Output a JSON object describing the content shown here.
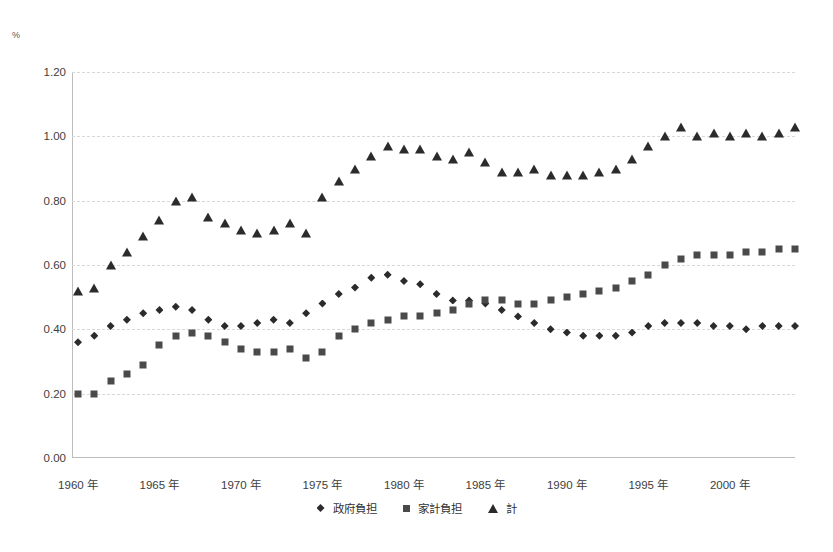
{
  "chart_data": {
    "type": "scatter",
    "title": "",
    "xlabel": "",
    "ylabel": "",
    "unit_label": "%",
    "grid": true,
    "legend_position": "bottom",
    "ylim": [
      0.0,
      1.2
    ],
    "ytick_labels": [
      "1.20",
      "1.00",
      "0.80",
      "0.60",
      "0.40",
      "0.20",
      "0.00"
    ],
    "ytick_values": [
      1.2,
      1.0,
      0.8,
      0.6,
      0.4,
      0.2,
      0.0
    ],
    "xtick_labels": [
      "1960 年",
      "1965 年",
      "1970 年",
      "1975 年",
      "1980 年",
      "1985 年",
      "1990 年",
      "1995 年",
      "2000 年"
    ],
    "xtick_years": [
      1960,
      1965,
      1970,
      1975,
      1980,
      1985,
      1990,
      1995,
      2000
    ],
    "x": [
      1960,
      1961,
      1962,
      1963,
      1964,
      1965,
      1966,
      1967,
      1968,
      1969,
      1970,
      1971,
      1972,
      1973,
      1974,
      1975,
      1976,
      1977,
      1978,
      1979,
      1980,
      1981,
      1982,
      1983,
      1984,
      1985,
      1986,
      1987,
      1988,
      1989,
      1990,
      1991,
      1992,
      1993,
      1994,
      1995,
      1996,
      1997,
      1998,
      1999,
      2000,
      2001,
      2002,
      2003,
      2004
    ],
    "series": [
      {
        "name": "政府負担",
        "marker": "diamond",
        "color": "#2b2b2b",
        "values": [
          0.36,
          0.38,
          0.41,
          0.43,
          0.45,
          0.46,
          0.47,
          0.46,
          0.43,
          0.41,
          0.41,
          0.42,
          0.43,
          0.42,
          0.45,
          0.48,
          0.51,
          0.53,
          0.56,
          0.57,
          0.55,
          0.54,
          0.51,
          0.49,
          0.49,
          0.48,
          0.46,
          0.44,
          0.42,
          0.4,
          0.39,
          0.38,
          0.38,
          0.38,
          0.39,
          0.41,
          0.42,
          0.42,
          0.42,
          0.41,
          0.41,
          0.4,
          0.41,
          0.41,
          0.41
        ]
      },
      {
        "name": "家計負担",
        "marker": "square",
        "color": "#4a4a4a",
        "values": [
          0.2,
          0.2,
          0.24,
          0.26,
          0.29,
          0.35,
          0.38,
          0.39,
          0.38,
          0.36,
          0.34,
          0.33,
          0.33,
          0.34,
          0.31,
          0.33,
          0.38,
          0.4,
          0.42,
          0.43,
          0.44,
          0.44,
          0.45,
          0.46,
          0.48,
          0.49,
          0.49,
          0.48,
          0.48,
          0.49,
          0.5,
          0.51,
          0.52,
          0.53,
          0.55,
          0.57,
          0.6,
          0.62,
          0.63,
          0.63,
          0.63,
          0.64,
          0.64,
          0.65,
          0.65
        ]
      },
      {
        "name": "計",
        "marker": "triangle",
        "color": "#2b2b2b",
        "values": [
          0.52,
          0.53,
          0.6,
          0.64,
          0.69,
          0.74,
          0.8,
          0.81,
          0.75,
          0.73,
          0.71,
          0.7,
          0.71,
          0.73,
          0.7,
          0.81,
          0.86,
          0.9,
          0.94,
          0.97,
          0.96,
          0.96,
          0.94,
          0.93,
          0.95,
          0.92,
          0.89,
          0.89,
          0.9,
          0.88,
          0.88,
          0.88,
          0.89,
          0.9,
          0.93,
          0.97,
          1.0,
          1.03,
          1.0,
          1.01,
          1.0,
          1.01,
          1.0,
          1.01,
          1.03
        ]
      }
    ]
  }
}
